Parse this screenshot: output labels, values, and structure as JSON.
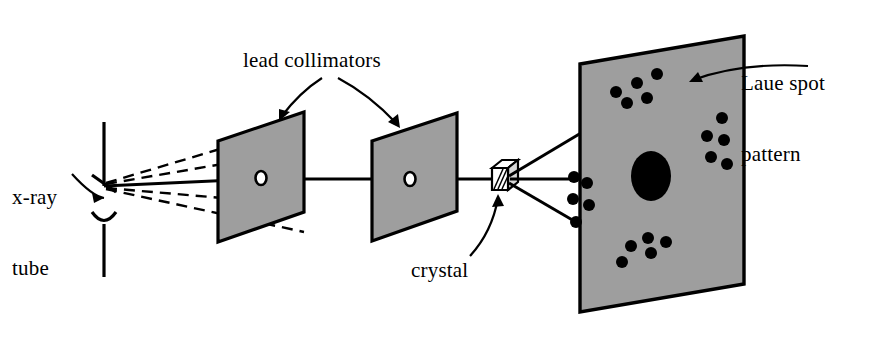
{
  "figure": {
    "background_color": "#ffffff",
    "stroke_color": "#000000",
    "panel_fill_color": "#9e9e9e",
    "spot_color": "#000000"
  },
  "labels": {
    "xray_tube_line1": "x-ray",
    "xray_tube_line2": "tube",
    "lead_collimators": "lead collimators",
    "crystal": "crystal",
    "laue_pattern_line1": "Laue spot",
    "laue_pattern_line2": "pattern"
  },
  "chart_data": {
    "type": "scatter",
    "title": "Laue spot pattern",
    "xlabel": "",
    "ylabel": "",
    "grid": false,
    "legend": null,
    "central_spot": {
      "cx": 651,
      "cy": 176,
      "rx": 20,
      "ry": 25
    },
    "clusters": [
      {
        "name": "top-cluster",
        "count": 5,
        "points": [
          {
            "cx": 616,
            "cy": 92,
            "r": 6
          },
          {
            "cx": 637,
            "cy": 83,
            "r": 6
          },
          {
            "cx": 657,
            "cy": 74,
            "r": 6
          },
          {
            "cx": 647,
            "cy": 98,
            "r": 6
          },
          {
            "cx": 627,
            "cy": 103,
            "r": 6
          }
        ]
      },
      {
        "name": "right-cluster",
        "count": 5,
        "points": [
          {
            "cx": 722,
            "cy": 118,
            "r": 6
          },
          {
            "cx": 707,
            "cy": 136,
            "r": 6
          },
          {
            "cx": 724,
            "cy": 140,
            "r": 6
          },
          {
            "cx": 711,
            "cy": 157,
            "r": 6
          },
          {
            "cx": 727,
            "cy": 164,
            "r": 6
          }
        ]
      },
      {
        "name": "bottom-cluster",
        "count": 5,
        "points": [
          {
            "cx": 648,
            "cy": 238,
            "r": 6
          },
          {
            "cx": 666,
            "cy": 242,
            "r": 6
          },
          {
            "cx": 631,
            "cy": 246,
            "r": 6
          },
          {
            "cx": 651,
            "cy": 253,
            "r": 6
          },
          {
            "cx": 622,
            "cy": 262,
            "r": 6
          }
        ]
      },
      {
        "name": "left-cluster",
        "count": 5,
        "points": [
          {
            "cx": 574,
            "cy": 177,
            "r": 6
          },
          {
            "cx": 587,
            "cy": 183,
            "r": 6
          },
          {
            "cx": 573,
            "cy": 199,
            "r": 6
          },
          {
            "cx": 589,
            "cy": 205,
            "r": 6
          },
          {
            "cx": 576,
            "cy": 222,
            "r": 6
          }
        ]
      }
    ]
  },
  "components": {
    "xray_tube": {
      "name": "x-ray tube",
      "source_x": 103,
      "source_y": 185
    },
    "collimator_1": {
      "name": "first lead collimator",
      "hole_x": 261,
      "hole_y": 178
    },
    "collimator_2": {
      "name": "second lead collimator",
      "hole_x": 410,
      "hole_y": 179
    },
    "crystal": {
      "name": "crystal specimen",
      "x": 492,
      "y": 168
    },
    "detector_screen": {
      "name": "photographic film screen"
    }
  },
  "beams": {
    "divergent_dashed_rays": 4,
    "direct_beam_solid": 1,
    "diffracted_solid_rays": 3
  }
}
